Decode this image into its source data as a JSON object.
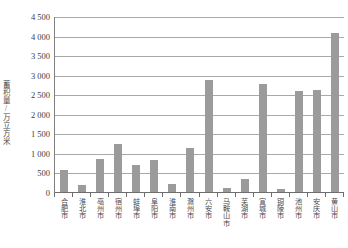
{
  "chart_data": {
    "type": "bar",
    "title": "",
    "xlabel": "",
    "ylabel": "蓄积量/万立方米",
    "ylim": [
      0,
      4500
    ],
    "ytick_step": 500,
    "grid": true,
    "legend": false,
    "bar_color": "#9b9b9b",
    "gridline_color": "#a9a9a9",
    "axis_color": "#6e6e6e",
    "ytick_labels": [
      "4 500",
      "4 000",
      "3 500",
      "3 000",
      "2 500",
      "2 000",
      "1 500",
      "1 000",
      "500",
      "0"
    ],
    "ytick_values": [
      4500,
      4000,
      3500,
      3000,
      2500,
      2000,
      1500,
      1000,
      500,
      0
    ],
    "categories": [
      "合肥市",
      "淮北市",
      "亳州市",
      "宿州市",
      "蚌埠市",
      "阜阳市",
      "淮南市",
      "滁州市",
      "六安市",
      "马鞍山市",
      "芜湖市",
      "宣城市",
      "铜陵市",
      "池州市",
      "安庆市",
      "黄山市"
    ],
    "values": [
      590,
      210,
      880,
      1250,
      720,
      850,
      240,
      1160,
      2900,
      120,
      350,
      2800,
      90,
      2620,
      2640,
      4100
    ]
  }
}
